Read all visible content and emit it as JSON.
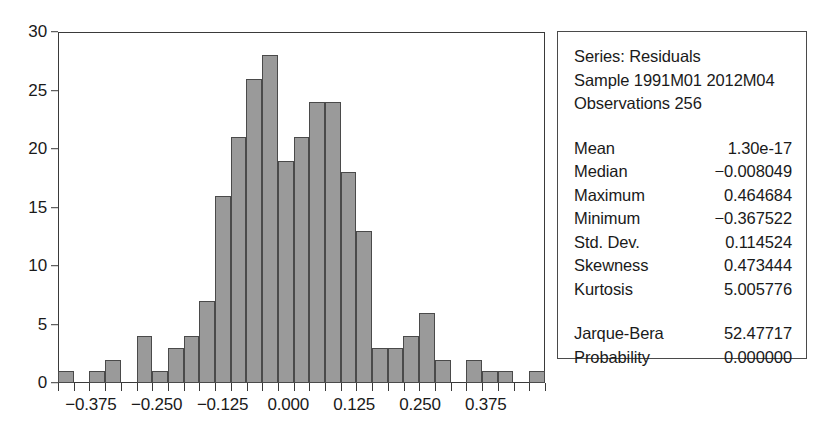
{
  "chart_data": {
    "type": "bar",
    "title": "",
    "subtitle": "",
    "xlabel": "",
    "ylabel": "",
    "xlim": [
      -0.4375,
      0.4875
    ],
    "ylim": [
      0,
      30
    ],
    "grid": false,
    "legend_position": "none",
    "bin_width": 0.0375,
    "bar_color": "#9a9a9a",
    "bar_edge_color": "#4a4a4a",
    "y_ticks": [
      "0",
      "5",
      "10",
      "15",
      "20",
      "25",
      "30"
    ],
    "y_tick_values": [
      0,
      5,
      10,
      15,
      20,
      25,
      30
    ],
    "x_ticks": [
      "-0.375",
      "-0.250",
      "-0.125",
      "0.000",
      "0.125",
      "0.250",
      "0.375"
    ],
    "x_tick_values": [
      -0.375,
      -0.25,
      -0.125,
      0.0,
      0.125,
      0.25,
      0.375
    ],
    "categories": [
      "-0.4125",
      "-0.3750",
      "-0.3375",
      "-0.3000",
      "-0.2625",
      "-0.2250",
      "-0.1875",
      "-0.1500",
      "-0.1125",
      "-0.0750",
      "-0.0375",
      "0.0000",
      "0.0375",
      "0.0750",
      "0.1125",
      "0.1500",
      "0.1875",
      "0.2250",
      "0.2625",
      "0.3000",
      "0.3375",
      "0.3750",
      "0.4125",
      "0.4500"
    ],
    "values": [
      1,
      0,
      1,
      2,
      0,
      4,
      1,
      3,
      4,
      7,
      16,
      21,
      26,
      28,
      19,
      21,
      24,
      24,
      18,
      13,
      3,
      3,
      4,
      6
    ],
    "values_tail": [
      2,
      0,
      2,
      1,
      1,
      0,
      1
    ],
    "annotations": []
  },
  "stats_panel": {
    "header_lines": [
      "Series: Residuals",
      "Sample 1991M01 2012M04",
      "Observations 256"
    ],
    "series_name": "Residuals",
    "sample": "1991M01 2012M04",
    "observations": "256",
    "rows": [
      {
        "key": "Mean",
        "value": "1.30e-17"
      },
      {
        "key": "Median",
        "value": "−0.008049"
      },
      {
        "key": "Maximum",
        "value": "0.464684"
      },
      {
        "key": "Minimum",
        "value": "−0.367522"
      },
      {
        "key": "Std. Dev.",
        "value": "0.114524"
      },
      {
        "key": "Skewness",
        "value": "0.473444"
      },
      {
        "key": "Kurtosis",
        "value": "5.005776"
      }
    ],
    "test_rows": [
      {
        "key": "Jarque-Bera",
        "value": "52.47717"
      },
      {
        "key": "Probability",
        "value": "0.000000"
      }
    ]
  }
}
